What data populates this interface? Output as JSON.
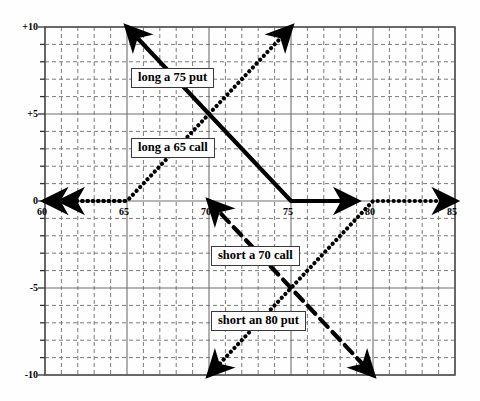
{
  "figure": {
    "title": "",
    "background": "#fefefe",
    "frame_color": "#555555",
    "grid_major_color": "#6f6f6f",
    "grid_minor_color": "#7a7a7a",
    "curve_color": "#000000"
  },
  "axes": {
    "x_ticks": [
      "60",
      "65",
      "70",
      "75",
      "80",
      "85"
    ],
    "x_tick_values": [
      60,
      65,
      70,
      75,
      80,
      85
    ],
    "y_ticks": [
      "+10",
      "+5",
      "0",
      "-5",
      "-10"
    ],
    "y_tick_values": [
      10,
      5,
      0,
      -5,
      -10
    ],
    "xlim": [
      60,
      85
    ],
    "ylim": [
      -10,
      10
    ],
    "x_minor_step": 1,
    "y_minor_step": 1,
    "xlabel": "",
    "ylabel": ""
  },
  "callouts": [
    {
      "id": "long-75-put",
      "label": "long a 75 put",
      "x": 131,
      "y": 68
    },
    {
      "id": "long-65-call",
      "label": "long a 65 call",
      "x": 131,
      "y": 138
    },
    {
      "id": "short-70-call",
      "label": "short a 70 call",
      "x": 211,
      "y": 246
    },
    {
      "id": "short-80-put",
      "label": "short an 80 put",
      "x": 211,
      "y": 311
    }
  ],
  "chart_data": {
    "type": "line",
    "xlabel": "",
    "ylabel": "",
    "xlim": [
      60,
      85
    ],
    "ylim": [
      -10,
      10
    ],
    "grid": true,
    "legend": "annotations",
    "series": [
      {
        "name": "long a 75 put",
        "style": "solid",
        "strike": 75,
        "points": [
          [
            65,
            10
          ],
          [
            75,
            0
          ],
          [
            79,
            0
          ]
        ],
        "arrows": [
          "start",
          "end"
        ],
        "description": "Payoff rises to the left of the 75 strike, flat at 0 above 75"
      },
      {
        "name": "long a 65 call",
        "style": "dotted",
        "strike": 65,
        "points": [
          [
            61,
            0
          ],
          [
            65,
            0
          ],
          [
            75,
            10
          ]
        ],
        "arrows": [
          "start",
          "end"
        ],
        "description": "Flat at 0 below the 65 strike, rises one-for-one above it"
      },
      {
        "name": "short a 70 call",
        "style": "dashed",
        "strike": 70,
        "points": [
          [
            70,
            0
          ],
          [
            80,
            -10
          ]
        ],
        "arrows": [
          "start",
          "end"
        ],
        "description": "Flat at 0 below the 70 strike, falls one-for-one above it"
      },
      {
        "name": "short an 80 put",
        "style": "dotted",
        "strike": 80,
        "points": [
          [
            70,
            -10
          ],
          [
            80,
            0
          ],
          [
            85,
            0
          ]
        ],
        "arrows": [
          "start",
          "end"
        ],
        "description": "Rises up to the 80 strike, flat at 0 above it"
      },
      {
        "name": "zero axis left segment",
        "style": "dotted-axis",
        "points": [
          [
            60,
            0
          ],
          [
            65,
            0
          ]
        ],
        "arrows": [
          "start"
        ],
        "description": "Zero-payoff ray running left from 65"
      }
    ]
  }
}
